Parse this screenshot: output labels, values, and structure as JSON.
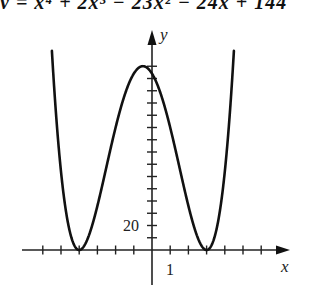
{
  "header": {
    "equation_fragment": "y = x⁴ + 2x³ − 23x² − 24x + 144"
  },
  "chart_data": {
    "type": "line",
    "title": "y = x⁴ + 2x³ − 23x² − 24x + 144",
    "function": "y = x^4 + 2x^3 - 23x^2 - 24x + 144 = (x+4)^2 (x-3)^2",
    "xlabel": "x",
    "ylabel": "y",
    "xlim": [
      -6,
      7.5
    ],
    "ylim": [
      -30,
      175
    ],
    "x_ticks_step": 1,
    "y_ticks_step": 10,
    "tick_labels": {
      "x": [
        {
          "value": 1,
          "label": "1"
        }
      ],
      "y": [
        {
          "value": 20,
          "label": "20"
        }
      ]
    },
    "key_points": [
      {
        "x": -4,
        "y": 0,
        "note": "local minimum"
      },
      {
        "x": -0.5,
        "y": 150.06,
        "note": "local maximum"
      },
      {
        "x": 3,
        "y": 0,
        "note": "local minimum"
      }
    ],
    "grid": false,
    "legend": null,
    "pixel_map": {
      "origin_x": 152,
      "origin_y": 250,
      "px_per_x": 18.2,
      "px_per_y": 1.225,
      "clip_top": 50
    }
  }
}
